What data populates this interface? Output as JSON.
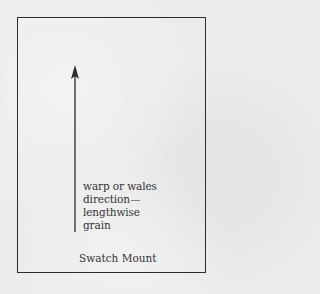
{
  "diagram": {
    "caption_lines": [
      "warp or wales",
      "direction—",
      "lengthwise",
      "grain"
    ],
    "label": "Swatch Mount",
    "arrow": {
      "direction": "up",
      "meaning": "lengthwise grain"
    },
    "colors": {
      "paper": "#ececec",
      "ink": "#2b2b2b"
    }
  }
}
